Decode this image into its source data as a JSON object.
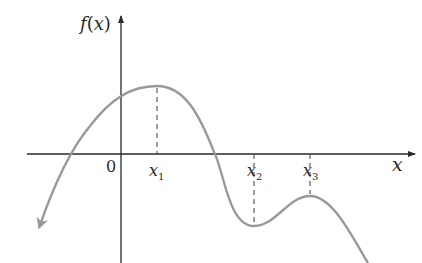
{
  "diagram": {
    "y_axis_label_func": "f",
    "y_axis_label_paren_open": "(",
    "y_axis_label_var": "x",
    "y_axis_label_paren_close": ")",
    "x_axis_label": "x",
    "origin_label": "0",
    "points": [
      {
        "name": "x",
        "sub": "1",
        "type": "local maximum"
      },
      {
        "name": "x",
        "sub": "2",
        "type": "local minimum"
      },
      {
        "name": "x",
        "sub": "3",
        "type": "local maximum"
      }
    ],
    "colors": {
      "axis": "#2a2a2a",
      "curve": "#999999",
      "dashed": "#3a3a3a",
      "background": "#ffffff"
    }
  }
}
